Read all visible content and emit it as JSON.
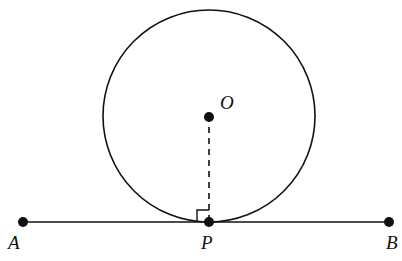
{
  "diagram": {
    "type": "geometry",
    "stroke_color": "#111111",
    "circle": {
      "center_label": "O",
      "cx": 209,
      "cy": 116,
      "r": 106
    },
    "points": [
      {
        "label": "A",
        "x": 23,
        "y": 222
      },
      {
        "label": "P",
        "x": 209,
        "y": 222
      },
      {
        "label": "B",
        "x": 389,
        "y": 222
      },
      {
        "label": "O",
        "x": 209,
        "y": 116
      }
    ],
    "segments": [
      {
        "from": "A",
        "to": "B",
        "style": "solid"
      },
      {
        "from": "O",
        "to": "P",
        "style": "dashed"
      }
    ],
    "right_angle_marker": {
      "at": "P",
      "size": 12
    },
    "labels": {
      "A": "A",
      "P": "P",
      "B": "B",
      "O": "O"
    }
  }
}
